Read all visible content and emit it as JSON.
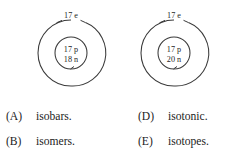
{
  "question": {
    "diagrams": [
      {
        "id": "atom-left",
        "shell_label": "17 e",
        "nucleus_lines": [
          "17 p",
          "18 n"
        ],
        "cx": 71,
        "cy": 53,
        "outer_r": 33,
        "inner_r": 16
      },
      {
        "id": "atom-right",
        "shell_label": "17 e",
        "nucleus_lines": [
          "17 p",
          "20 n"
        ],
        "cx": 174,
        "cy": 53,
        "outer_r": 33,
        "inner_r": 16
      }
    ],
    "options": [
      {
        "letter": "(A)",
        "text": "isobars."
      },
      {
        "letter": "(B)",
        "text": "isomers."
      },
      {
        "letter": "(D)",
        "text": "isotonic."
      },
      {
        "letter": "(E)",
        "text": "isotopes."
      }
    ]
  },
  "colors": {
    "ink": "#1f1f1f",
    "stroke": "#3a3a3a",
    "background": "#ffffff"
  }
}
